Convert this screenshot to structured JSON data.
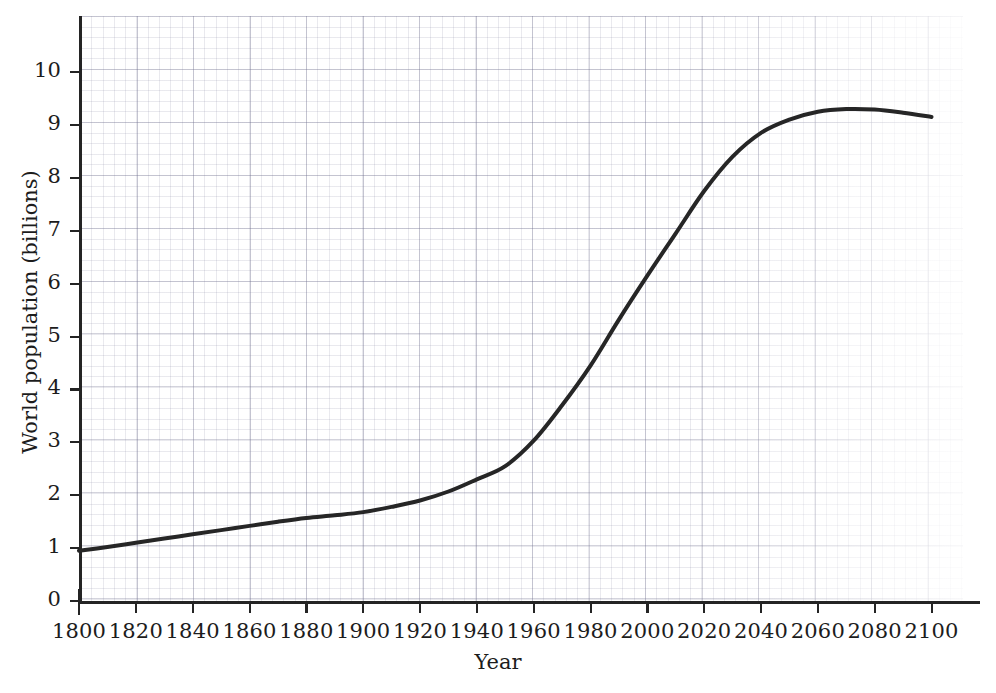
{
  "chart_data": {
    "type": "line",
    "title": "",
    "subtitle": "",
    "xlabel": "Year",
    "ylabel": "World population (billions)",
    "xlim": [
      1800,
      2100
    ],
    "ylim": [
      0,
      10.8
    ],
    "grid": "graph-paper minor and major grid, no axis gridlines drawn over plot",
    "legend": "none",
    "x_ticks": [
      1800,
      1820,
      1840,
      1860,
      1880,
      1900,
      1920,
      1940,
      1960,
      1980,
      2000,
      2020,
      2040,
      2060,
      2080,
      2100
    ],
    "y_ticks": [
      0,
      1,
      2,
      3,
      4,
      5,
      6,
      7,
      8,
      9,
      10
    ],
    "line_color": "#262626",
    "line_width": 4,
    "series": [
      {
        "name": "World population",
        "x": [
          1800,
          1810,
          1820,
          1830,
          1840,
          1850,
          1860,
          1870,
          1880,
          1890,
          1900,
          1910,
          1920,
          1930,
          1940,
          1950,
          1960,
          1970,
          1980,
          1990,
          2000,
          2010,
          2020,
          2030,
          2040,
          2050,
          2060,
          2070,
          2080,
          2090,
          2100
        ],
        "values": [
          0.95,
          1.02,
          1.1,
          1.18,
          1.26,
          1.34,
          1.42,
          1.5,
          1.57,
          1.62,
          1.68,
          1.78,
          1.9,
          2.07,
          2.3,
          2.55,
          3.03,
          3.7,
          4.45,
          5.32,
          6.15,
          6.95,
          7.75,
          8.4,
          8.85,
          9.1,
          9.25,
          9.3,
          9.29,
          9.23,
          9.15
        ]
      }
    ]
  },
  "axes": {
    "x_title": "Year",
    "y_title": "World population (billions)",
    "x_tick_labels": [
      "1800",
      "1820",
      "1840",
      "1860",
      "1880",
      "1900",
      "1920",
      "1940",
      "1960",
      "1980",
      "2000",
      "2020",
      "2040",
      "2060",
      "2080",
      "2100"
    ],
    "y_tick_labels": [
      "0",
      "1",
      "2",
      "3",
      "4",
      "5",
      "6",
      "7",
      "8",
      "9",
      "10"
    ]
  },
  "style": {
    "background": "#ffffff",
    "axis_color": "#242424",
    "text_color": "#1c1c1c",
    "grid_color": "#7878963f"
  }
}
